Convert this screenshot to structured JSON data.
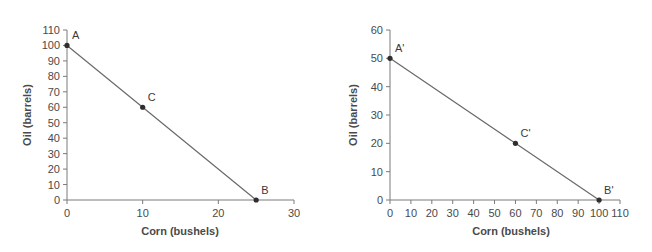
{
  "chart_data": [
    {
      "type": "line",
      "title": "",
      "xlabel": "Corn (bushels)",
      "ylabel": "Oil (barrels)",
      "xlim": [
        0,
        30
      ],
      "ylim": [
        0,
        110
      ],
      "x_ticks": [
        0,
        10,
        20,
        30
      ],
      "y_ticks": [
        0,
        10,
        20,
        30,
        40,
        50,
        60,
        70,
        80,
        90,
        100,
        110
      ],
      "grid": false,
      "legend": null,
      "series": [
        {
          "name": "Production possibilities frontier",
          "points": [
            {
              "label": "A",
              "x": 0,
              "y": 100
            },
            {
              "label": "C",
              "x": 10,
              "y": 60
            },
            {
              "label": "B",
              "x": 25,
              "y": 0
            }
          ]
        }
      ]
    },
    {
      "type": "line",
      "title": "",
      "xlabel": "Corn (bushels)",
      "ylabel": "Oil (barrels)",
      "xlim": [
        0,
        110
      ],
      "ylim": [
        0,
        60
      ],
      "x_ticks": [
        0,
        10,
        20,
        30,
        40,
        50,
        60,
        70,
        80,
        90,
        100,
        110
      ],
      "y_ticks": [
        0,
        10,
        20,
        30,
        40,
        50,
        60
      ],
      "grid": false,
      "legend": null,
      "series": [
        {
          "name": "Production possibilities frontier",
          "points": [
            {
              "label": "A'",
              "x": 0,
              "y": 50
            },
            {
              "label": "C'",
              "x": 60,
              "y": 20
            },
            {
              "label": "B'",
              "x": 100,
              "y": 0
            }
          ]
        }
      ]
    }
  ],
  "colors": {
    "axis": "#7a7a7a",
    "line": "#6a6a6a",
    "point": "#2e2e2e",
    "text": "#4a4a4a"
  }
}
